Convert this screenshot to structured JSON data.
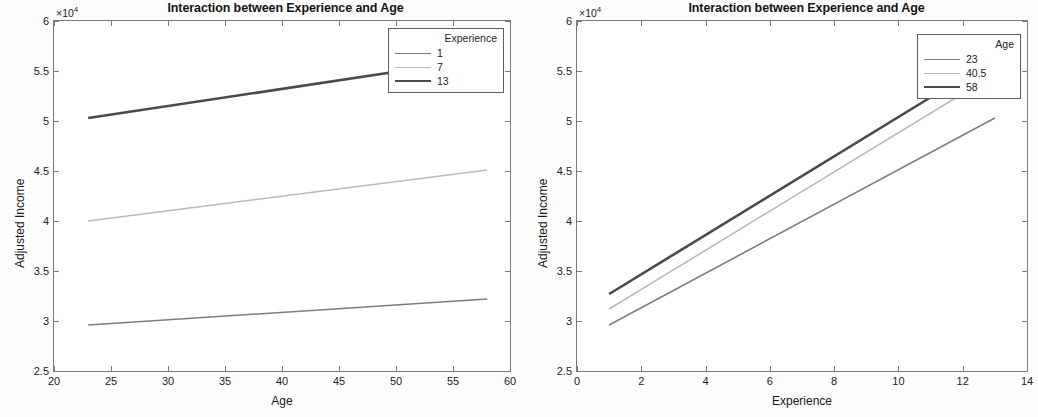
{
  "figure": {
    "width": 1038,
    "height": 417,
    "background": "#ffffff"
  },
  "colors": {
    "series_light": "#7d7d7d",
    "series_mid": "#b9b9b9",
    "series_dark": "#4a4a4a",
    "axis": "#7a7a7a",
    "text": "#1a1a1a"
  },
  "chart_data": [
    {
      "type": "line",
      "panel": "left",
      "title": "Interaction between Experience and Age",
      "xlabel": "Age",
      "ylabel": "Adjusted Income",
      "y_multiplier": "×10",
      "y_multiplier_exp": "4",
      "xlim": [
        20,
        60
      ],
      "ylim": [
        2.5,
        6
      ],
      "xticks": [
        "20",
        "25",
        "30",
        "35",
        "40",
        "45",
        "50",
        "55",
        "60"
      ],
      "yticks": [
        "2.5",
        "3",
        "3.5",
        "4",
        "4.5",
        "5",
        "5.5",
        "6"
      ],
      "grid": false,
      "legend": {
        "title": "Experience",
        "position": "top-right",
        "entries": [
          "1",
          "7",
          "13"
        ]
      },
      "x": [
        23,
        58
      ],
      "series": [
        {
          "name": "1",
          "values": [
            2.96,
            3.22
          ],
          "color": "#7d7d7d",
          "width": 1.6
        },
        {
          "name": "7",
          "values": [
            4.0,
            4.51
          ],
          "color": "#b9b9b9",
          "width": 1.6
        },
        {
          "name": "13",
          "values": [
            5.03,
            5.63
          ],
          "color": "#4a4a4a",
          "width": 2.6
        }
      ]
    },
    {
      "type": "line",
      "panel": "right",
      "title": "Interaction between Experience and Age",
      "xlabel": "Experience",
      "ylabel": "Adjusted Income",
      "y_multiplier": "×10",
      "y_multiplier_exp": "4",
      "xlim": [
        0,
        14
      ],
      "ylim": [
        2.5,
        6
      ],
      "xticks": [
        "0",
        "2",
        "4",
        "6",
        "8",
        "10",
        "12",
        "14"
      ],
      "yticks": [
        "2.5",
        "3",
        "3.5",
        "4",
        "4.5",
        "5",
        "5.5",
        "6"
      ],
      "grid": false,
      "legend": {
        "title": "Age",
        "position": "top-right",
        "entries": [
          "23",
          "40.5",
          "58"
        ]
      },
      "x": [
        1,
        13
      ],
      "series": [
        {
          "name": "23",
          "values": [
            2.96,
            5.03
          ],
          "color": "#7d7d7d",
          "width": 1.6
        },
        {
          "name": "40.5",
          "values": [
            3.12,
            5.47
          ],
          "color": "#b9b9b9",
          "width": 1.6
        },
        {
          "name": "58",
          "values": [
            3.27,
            5.63
          ],
          "color": "#4a4a4a",
          "width": 2.6
        }
      ]
    }
  ]
}
